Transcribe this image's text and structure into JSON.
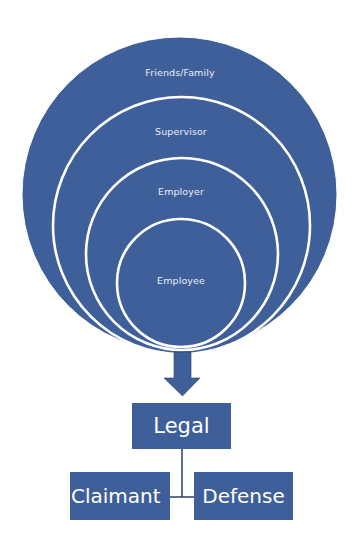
{
  "colors": {
    "fill": "#3f5f9a",
    "ring_stroke": "#ffffff",
    "connector": "#2c3f63",
    "label_text": "#e9eef7",
    "background": "#ffffff"
  },
  "circles": {
    "layers": [
      {
        "label": "Friends/Family",
        "level": "outer"
      },
      {
        "label": "Supervisor",
        "level": "second"
      },
      {
        "label": "Employer",
        "level": "third"
      },
      {
        "label": "Employee",
        "level": "inner"
      }
    ]
  },
  "arrow": {
    "icon": "down-arrow-icon",
    "direction": "down"
  },
  "hierarchy": {
    "root": {
      "label": "Legal"
    },
    "children": [
      {
        "label": "Claimant"
      },
      {
        "label": "Defense"
      }
    ]
  }
}
